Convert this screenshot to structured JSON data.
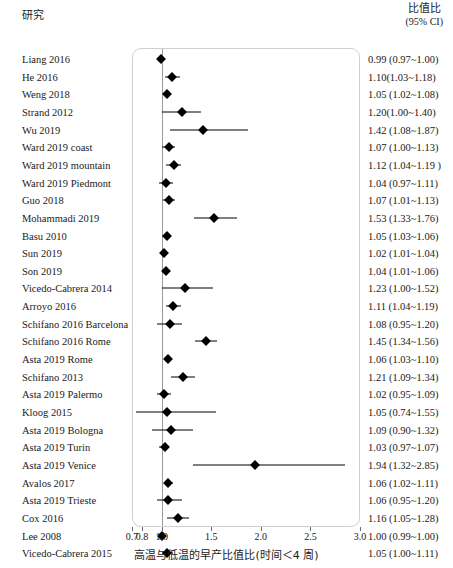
{
  "header": {
    "study_label": "研究",
    "or_label": "比值比",
    "ci_label": "(95% CI)"
  },
  "axis": {
    "title": "高温与低温的早产比值比(时间＜4 周)",
    "ticks": [
      0.7,
      0.8,
      1.0,
      1.5,
      2.0,
      2.5,
      3.0
    ],
    "tick_labels": [
      "0.7",
      "0.8",
      "1.0",
      "1.5",
      "2.0",
      "2.5",
      "3.0"
    ],
    "xmin": 0.7,
    "xmax": 3.0,
    "null_value": 1.0
  },
  "chart_data": {
    "type": "forest",
    "title": "",
    "xlabel": "高温与低温的早产比值比(时间＜4 周)",
    "ylabel": "研究",
    "xlim": [
      0.7,
      3.0
    ],
    "xscale": "linear",
    "grid": false,
    "legend": "none",
    "null_line": 1.0,
    "effect_measure": "比值比 (95% CI)",
    "columns": [
      "研究",
      "比值比 (95% CI)"
    ],
    "studies": [
      {
        "label": "Liang 2016",
        "estimate": 0.99,
        "lower": 0.97,
        "upper": 1.0,
        "text": "0.99 (0.97~1.00)"
      },
      {
        "label": "He 2016",
        "estimate": 1.1,
        "lower": 1.03,
        "upper": 1.18,
        "text": "1.10(1.03~1.18)"
      },
      {
        "label": "Weng 2018",
        "estimate": 1.05,
        "lower": 1.02,
        "upper": 1.08,
        "text": "1.05 (1.02~1.08)"
      },
      {
        "label": "Strand 2012",
        "estimate": 1.2,
        "lower": 1.0,
        "upper": 1.4,
        "text": "1.20(1.00~1.40)"
      },
      {
        "label": "Wu 2019",
        "estimate": 1.42,
        "lower": 1.08,
        "upper": 1.87,
        "text": "1.42 (1.08~1.87)"
      },
      {
        "label": "Ward 2019 coast",
        "estimate": 1.07,
        "lower": 1.0,
        "upper": 1.13,
        "text": "1.07 (1.00~1.13)"
      },
      {
        "label": "Ward 2019 mountain",
        "estimate": 1.12,
        "lower": 1.04,
        "upper": 1.19,
        "text": "1.12 (1.04~1.19 )"
      },
      {
        "label": "Ward 2019 Piedmont",
        "estimate": 1.04,
        "lower": 0.97,
        "upper": 1.11,
        "text": "1.04 (0.97~1.11)"
      },
      {
        "label": "Guo 2018",
        "estimate": 1.07,
        "lower": 1.01,
        "upper": 1.13,
        "text": "1.07 (1.01~1.13)"
      },
      {
        "label": "Mohammadi 2019",
        "estimate": 1.53,
        "lower": 1.33,
        "upper": 1.76,
        "text": "1.53 (1.33~1.76)"
      },
      {
        "label": "Basu 2010",
        "estimate": 1.05,
        "lower": 1.03,
        "upper": 1.06,
        "text": "1.05 (1.03~1.06)"
      },
      {
        "label": "Sun 2019",
        "estimate": 1.02,
        "lower": 1.01,
        "upper": 1.04,
        "text": "1.02 (1.01~1.04)"
      },
      {
        "label": "Son 2019",
        "estimate": 1.04,
        "lower": 1.01,
        "upper": 1.06,
        "text": "1.04 (1.01~1.06)"
      },
      {
        "label": "Vicedo-Cabrera 2014",
        "estimate": 1.23,
        "lower": 1.0,
        "upper": 1.52,
        "text": "1.23 (1.00~1.52)"
      },
      {
        "label": "Arroyo 2016",
        "estimate": 1.11,
        "lower": 1.04,
        "upper": 1.19,
        "text": "1.11 (1.04~1.19)"
      },
      {
        "label": "Schifano 2016 Barcelona",
        "estimate": 1.08,
        "lower": 0.95,
        "upper": 1.2,
        "text": "1.08 (0.95~1.20)"
      },
      {
        "label": "Schifano 2016 Rome",
        "estimate": 1.45,
        "lower": 1.34,
        "upper": 1.56,
        "text": "1.45 (1.34~1.56)"
      },
      {
        "label": "Asta 2019 Rome",
        "estimate": 1.06,
        "lower": 1.03,
        "upper": 1.1,
        "text": "1.06 (1.03~1.10)"
      },
      {
        "label": "Schifano 2013",
        "estimate": 1.21,
        "lower": 1.09,
        "upper": 1.34,
        "text": "1.21 (1.09~1.34)"
      },
      {
        "label": "Asta 2019 Palermo",
        "estimate": 1.02,
        "lower": 0.95,
        "upper": 1.09,
        "text": "1.02 (0.95~1.09)"
      },
      {
        "label": "Kloog 2015",
        "estimate": 1.05,
        "lower": 0.74,
        "upper": 1.55,
        "text": "1.05 (0.74~1.55)"
      },
      {
        "label": "Asta 2019 Bologna",
        "estimate": 1.09,
        "lower": 0.9,
        "upper": 1.32,
        "text": "1.09 (0.90~1.32)"
      },
      {
        "label": "Asta 2019 Turin",
        "estimate": 1.03,
        "lower": 0.97,
        "upper": 1.07,
        "text": "1.03 (0.97~1.07)"
      },
      {
        "label": "Asta 2019 Venice",
        "estimate": 1.94,
        "lower": 1.32,
        "upper": 2.85,
        "text": "1.94 (1.32~2.85)"
      },
      {
        "label": "Avalos 2017",
        "estimate": 1.06,
        "lower": 1.02,
        "upper": 1.11,
        "text": "1.06 (1.02~1.11)"
      },
      {
        "label": "Asta 2019 Trieste",
        "estimate": 1.06,
        "lower": 0.95,
        "upper": 1.2,
        "text": "1.06 (0.95~1.20)"
      },
      {
        "label": "Cox 2016",
        "estimate": 1.16,
        "lower": 1.05,
        "upper": 1.28,
        "text": "1.16 (1.05~1.28)"
      },
      {
        "label": "Lee 2008",
        "estimate": 1.0,
        "lower": 0.99,
        "upper": 1.0,
        "text": "1.00 (0.99~1.00)"
      },
      {
        "label": "Vicedo-Cabrera 2015",
        "estimate": 1.05,
        "lower": 1.0,
        "upper": 1.11,
        "text": "1.05 (1.00~1.11)"
      }
    ]
  }
}
